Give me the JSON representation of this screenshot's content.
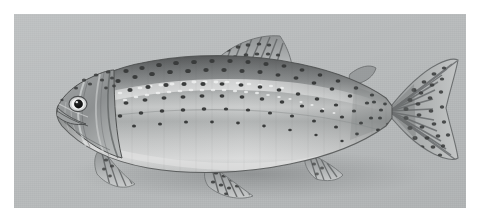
{
  "image": {
    "subject": "rainbow-trout",
    "common_name": "Rainbow trout",
    "orientation": "left-facing lateral view",
    "rendering": "grayscale photograph",
    "background_color": "#b9bcbd",
    "border_color": "#ffffff",
    "width": 480,
    "height": 222,
    "photo_rect": {
      "x": 14,
      "y": 14,
      "width": 452,
      "height": 194
    }
  },
  "palette": {
    "backdrop": "#b9bcbd",
    "dorsal_dark": "#5c5e5e",
    "dorsal_mid": "#7e8182",
    "flank_mid": "#9a9d9e",
    "flank_light": "#b8babb",
    "lateral_band": "#cfd1d1",
    "belly_light": "#d9dbdb",
    "belly_shadow": "#c2c4c4",
    "spot_color": "#3a3c3c",
    "fin_ray": "#6a6c6d",
    "fin_membrane": "#a9acad",
    "eye_pupil": "#1a1b1b",
    "eye_ring": "#f0f1f1",
    "outline": "#4e5050"
  },
  "anatomy": {
    "parts": [
      {
        "name": "head",
        "label": "Head"
      },
      {
        "name": "eye",
        "label": "Eye"
      },
      {
        "name": "mouth",
        "label": "Mouth"
      },
      {
        "name": "operculum",
        "label": "Gill cover"
      },
      {
        "name": "body",
        "label": "Body"
      },
      {
        "name": "lateral-line",
        "label": "Lateral line"
      },
      {
        "name": "dorsal-fin",
        "label": "Dorsal fin"
      },
      {
        "name": "adipose-fin",
        "label": "Adipose fin"
      },
      {
        "name": "pectoral-fin",
        "label": "Pectoral fin"
      },
      {
        "name": "pelvic-fin",
        "label": "Pelvic fin"
      },
      {
        "name": "anal-fin",
        "label": "Anal fin"
      },
      {
        "name": "caudal-fin",
        "label": "Caudal (tail) fin"
      },
      {
        "name": "caudal-peduncle",
        "label": "Caudal peduncle"
      }
    ]
  },
  "markings": {
    "description": "Dense dark spots across back, flanks, dorsal fin and tail",
    "spot_count_visible": 190
  }
}
